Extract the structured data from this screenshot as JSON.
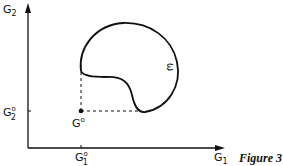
{
  "figure": {
    "caption": "Figure 3",
    "axes": {
      "x_label": "G",
      "x_label_sub": "1",
      "y_label": "G",
      "y_label_sub": "2"
    },
    "reference_point": {
      "label": "G",
      "label_sup": "o",
      "x_tick_label": "G",
      "x_tick_sup": "o",
      "x_tick_sub": "1",
      "y_tick_label": "G",
      "y_tick_sup": "o",
      "y_tick_sub": "2"
    },
    "region_label": "ω",
    "colors": {
      "ink": "#111111",
      "background": "#ffffff"
    }
  }
}
